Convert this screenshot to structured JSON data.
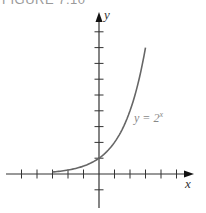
{
  "figure": {
    "title": "FIGURE 7.10"
  },
  "chart_data": {
    "type": "line",
    "title": "FIGURE 7.10",
    "xlabel": "x",
    "ylabel": "y",
    "series": [
      {
        "name": "y = 2^x",
        "label": "y = 2",
        "label_exp": "x",
        "x": [
          -3,
          -2.5,
          -2,
          -1.5,
          -1,
          -0.5,
          0,
          0.5,
          1,
          1.5,
          2,
          2.5,
          3
        ],
        "values": [
          0.125,
          0.177,
          0.25,
          0.354,
          0.5,
          0.707,
          1,
          1.414,
          2,
          2.828,
          4,
          5.657,
          8
        ]
      }
    ],
    "x_ticks": [
      -5,
      -4,
      -3,
      -2,
      -1,
      1,
      2,
      3,
      4,
      5
    ],
    "y_ticks": [
      -1,
      1,
      2,
      3,
      4,
      5,
      6,
      7,
      8,
      9
    ],
    "xlim": [
      -5.5,
      6
    ],
    "ylim": [
      -1.6,
      10
    ],
    "grid": false,
    "legend": "none",
    "annotations": [
      "y = 2^x"
    ],
    "colors": {
      "axis": "#333333",
      "curve": "#666666",
      "label": "#888888"
    }
  }
}
